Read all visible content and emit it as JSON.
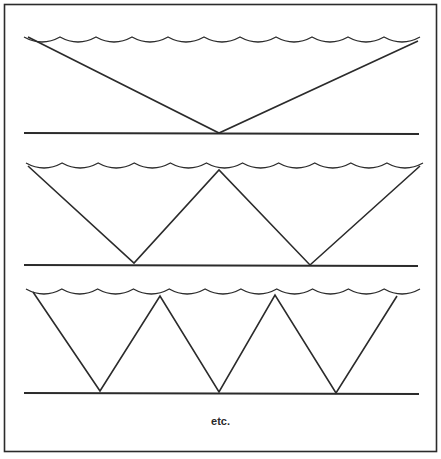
{
  "figure": {
    "caption": "etc.",
    "stroke_color": "#2b2b2b",
    "background": "#ffffff",
    "panels": [
      {
        "name": "single-reflection",
        "surface_y": 40,
        "floor_y": 133,
        "surface_x": [
          24,
          420
        ],
        "floor_x": [
          24,
          419
        ],
        "bounce_path": [
          [
            28,
            37
          ],
          [
            219,
            133
          ],
          [
            418,
            41
          ]
        ]
      },
      {
        "name": "double-reflection",
        "surface_y": 166,
        "floor_y": 265,
        "surface_x": [
          26,
          423
        ],
        "floor_x": [
          24,
          418
        ],
        "bounce_path": [
          [
            28,
            166
          ],
          [
            134,
            263
          ],
          [
            219,
            170
          ],
          [
            310,
            265
          ],
          [
            420,
            166
          ]
        ]
      },
      {
        "name": "triple-reflection",
        "surface_y": 292,
        "floor_y": 393,
        "surface_x": [
          26,
          420
        ],
        "floor_x": [
          24,
          419
        ],
        "bounce_path": [
          [
            33,
            292
          ],
          [
            100,
            391
          ],
          [
            160,
            296
          ],
          [
            219,
            392
          ],
          [
            275,
            295
          ],
          [
            336,
            393
          ],
          [
            397,
            296
          ]
        ]
      }
    ]
  }
}
